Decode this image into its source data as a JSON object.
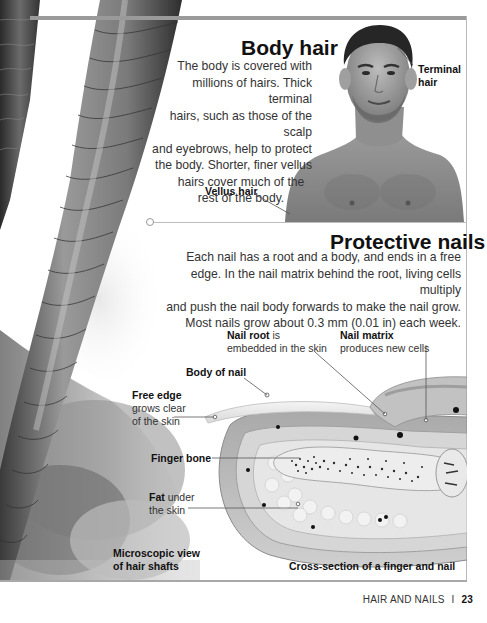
{
  "body_hair": {
    "title": "Body hair",
    "paragraph_lines": [
      "The body is covered with",
      "millions of hairs. Thick terminal",
      "hairs, such as those of the scalp",
      "and eyebrows, help to protect",
      "the body. Shorter, finer vellus",
      "hairs cover much of the",
      "rest of the body."
    ],
    "labels": {
      "terminal_hair_line1": "Terminal",
      "terminal_hair_line2": "hair",
      "vellus_hair": "Vellus hair"
    }
  },
  "protective_nails": {
    "title": "Protective nails",
    "paragraph_lines": [
      "Each nail has a root and a body, and ends in a free",
      "edge. In the nail matrix behind the root, living cells multiply",
      "and push the nail body forwards to make the nail grow.",
      "Most nails grow about 0.3 mm (0.01 in) each week."
    ],
    "labels": {
      "nail_root_bold": "Nail root",
      "nail_root_rest1": " is",
      "nail_root_rest2": "embedded in the skin",
      "nail_matrix_bold": "Nail matrix",
      "nail_matrix_rest": "produces new cells",
      "body_of_nail": "Body of nail",
      "free_edge_bold": "Free edge",
      "free_edge_rest1": "grows clear",
      "free_edge_rest2": "of the skin",
      "finger_bone": "Finger bone",
      "fat_bold": "Fat",
      "fat_rest1": " under",
      "fat_rest2": "the skin"
    }
  },
  "captions": {
    "microscopic_line1": "Microscopic view",
    "microscopic_line2": "of hair shafts",
    "cross_section": "Cross-section of a finger and nail"
  },
  "footer": {
    "section": "HAIR AND NAILS",
    "separator": "I",
    "page_number": "23"
  },
  "images": {
    "hair_shafts": "microscopic-hair-shaft-image",
    "portrait": "man-portrait-image",
    "finger": "finger-cross-section-illustration"
  }
}
